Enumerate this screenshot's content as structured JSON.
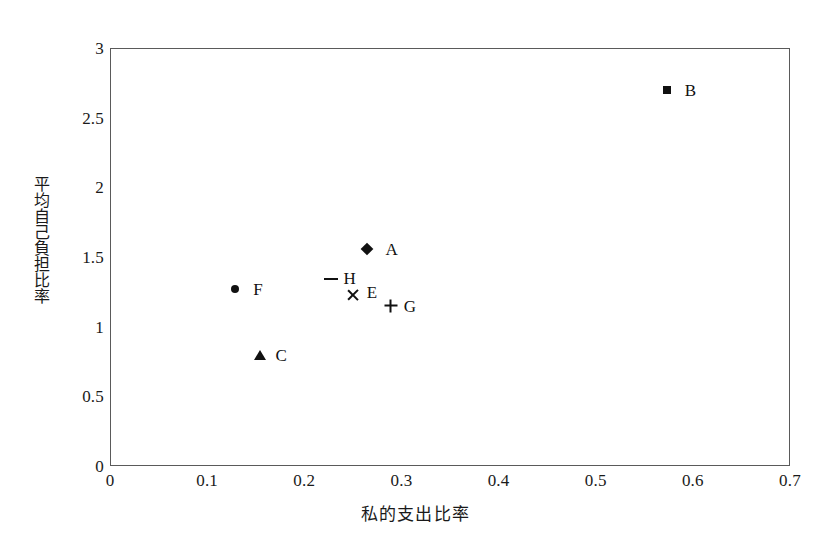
{
  "chart_data": {
    "type": "scatter",
    "title": "",
    "xlabel": "私的支出比率",
    "ylabel": "平均自己負担比率",
    "xlim": [
      0,
      0.7
    ],
    "ylim": [
      0,
      3
    ],
    "grid": false,
    "legend_position": "none",
    "xticks": [
      "0",
      "0.1",
      "0.2",
      "0.3",
      "0.4",
      "0.5",
      "0.6",
      "0.7"
    ],
    "xtick_values": [
      0,
      0.1,
      0.2,
      0.3,
      0.4,
      0.5,
      0.6,
      0.7
    ],
    "yticks": [
      "0",
      "0.5",
      "1",
      "1.5",
      "2",
      "2.5",
      "3"
    ],
    "ytick_values": [
      0,
      0.5,
      1,
      1.5,
      2,
      2.5,
      3
    ],
    "points": [
      {
        "label": "A",
        "x": 0.265,
        "y": 1.56,
        "marker": "diamond",
        "label_dx": 18,
        "label_dy": 0
      },
      {
        "label": "B",
        "x": 0.573,
        "y": 2.7,
        "marker": "square",
        "label_dx": 18,
        "label_dy": 0
      },
      {
        "label": "C",
        "x": 0.154,
        "y": 0.8,
        "marker": "triangle",
        "label_dx": 16,
        "label_dy": 0
      },
      {
        "label": "E",
        "x": 0.25,
        "y": 1.23,
        "marker": "cross",
        "label_dx": 14,
        "label_dy": -3
      },
      {
        "label": "F",
        "x": 0.129,
        "y": 1.27,
        "marker": "circle",
        "label_dx": 18,
        "label_dy": 0
      },
      {
        "label": "G",
        "x": 0.289,
        "y": 1.15,
        "marker": "plus",
        "label_dx": 13,
        "label_dy": 0
      },
      {
        "label": "H",
        "x": 0.227,
        "y": 1.34,
        "marker": "dash",
        "label_dx": 13,
        "label_dy": -1
      }
    ]
  }
}
